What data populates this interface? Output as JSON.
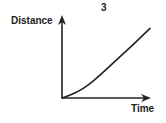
{
  "figure": {
    "number": "3"
  },
  "chart_data": {
    "type": "line",
    "title": "3",
    "xlabel": "Time",
    "ylabel": "Distance",
    "grid": false,
    "ticks": false,
    "series": [
      {
        "name": "distance",
        "points_normalized": [
          {
            "x": 0.0,
            "y": 0.0
          },
          {
            "x": 0.1,
            "y": 0.04
          },
          {
            "x": 0.2,
            "y": 0.09
          },
          {
            "x": 0.3,
            "y": 0.16
          },
          {
            "x": 0.4,
            "y": 0.25
          },
          {
            "x": 0.6,
            "y": 0.45
          },
          {
            "x": 0.8,
            "y": 0.65
          },
          {
            "x": 1.0,
            "y": 0.86
          }
        ]
      }
    ]
  },
  "colors": {
    "ink": "#222222",
    "background": "#ffffff"
  }
}
